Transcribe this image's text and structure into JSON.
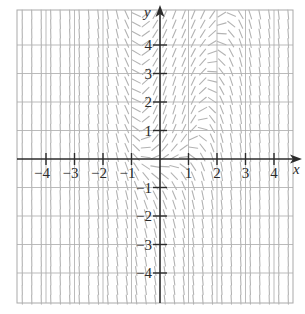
{
  "diagram": {
    "type": "slope-field",
    "axes": {
      "x_label": "x",
      "y_label": "y",
      "x_ticks": [
        "−4",
        "−3",
        "−2",
        "−1",
        "1",
        "2",
        "3",
        "4"
      ],
      "x_tick_values": [
        -4,
        -3,
        -2,
        -1,
        1,
        2,
        3,
        4
      ],
      "y_ticks": [
        "4",
        "3",
        "2",
        "1",
        "−1",
        "−2",
        "−3",
        "−4"
      ],
      "y_tick_values": [
        4,
        3,
        2,
        1,
        -1,
        -2,
        -3,
        -4
      ],
      "x_range": [
        -5,
        4.7
      ],
      "y_range": [
        -5.1,
        5.2
      ]
    },
    "grid": {
      "spacing": 1,
      "segments_per_unit": 3
    },
    "colors": {
      "axis": "#2b2b2b",
      "grid": "#a9a9a9",
      "segment": "#b3b3b3",
      "label": "#2a2a2a",
      "background": "#ffffff"
    }
  }
}
